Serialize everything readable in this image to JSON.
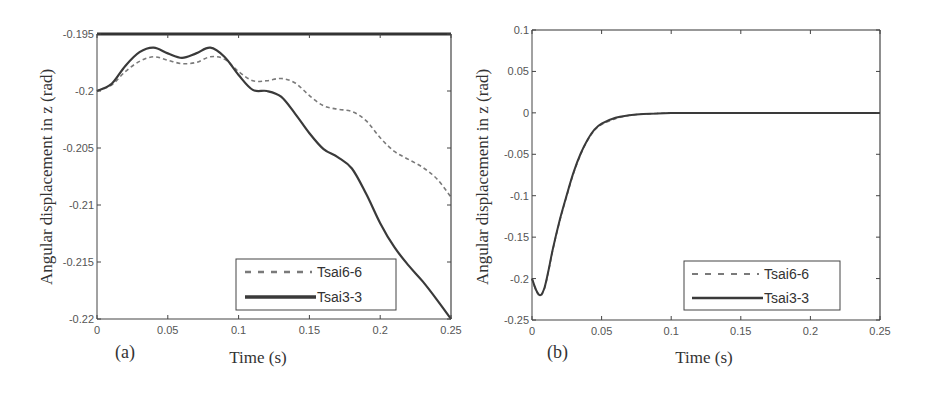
{
  "chart_data": [
    {
      "type": "line",
      "panel_label": "(a)",
      "title": "",
      "xlabel": "Time (s)",
      "ylabel": "Angular displacement in z (rad)",
      "xlim": [
        0,
        0.25
      ],
      "ylim": [
        -0.22,
        -0.195
      ],
      "xticks": [
        0,
        0.05,
        0.1,
        0.15,
        0.2,
        0.25
      ],
      "xtick_labels": [
        "0",
        "0.05",
        "0.1",
        "0.15",
        "0.2",
        "0.25"
      ],
      "yticks": [
        -0.195,
        -0.2,
        -0.205,
        -0.21,
        -0.215,
        -0.22
      ],
      "ytick_labels": [
        "-0.195",
        "-0.2",
        "-0.205",
        "-0.21",
        "-0.215",
        "-0.22"
      ],
      "grid": false,
      "legend_position": "lower right",
      "x": [
        0,
        0.01,
        0.02,
        0.03,
        0.04,
        0.05,
        0.06,
        0.07,
        0.08,
        0.09,
        0.1,
        0.11,
        0.12,
        0.13,
        0.14,
        0.15,
        0.16,
        0.17,
        0.18,
        0.19,
        0.2,
        0.21,
        0.22,
        0.23,
        0.24,
        0.25
      ],
      "series": [
        {
          "name": "Tsai6-6",
          "style": "dashed",
          "values": [
            -0.2,
            -0.1995,
            -0.1983,
            -0.1974,
            -0.197,
            -0.1973,
            -0.1976,
            -0.1975,
            -0.197,
            -0.1972,
            -0.1983,
            -0.1991,
            -0.1991,
            -0.1989,
            -0.1993,
            -0.2004,
            -0.2013,
            -0.2016,
            -0.2018,
            -0.2026,
            -0.2041,
            -0.2053,
            -0.206,
            -0.2067,
            -0.2077,
            -0.2093
          ]
        },
        {
          "name": "Tsai3-3",
          "style": "solid",
          "values": [
            -0.2,
            -0.1994,
            -0.1978,
            -0.1966,
            -0.1962,
            -0.1967,
            -0.1971,
            -0.1967,
            -0.1962,
            -0.197,
            -0.1986,
            -0.1999,
            -0.2,
            -0.2005,
            -0.202,
            -0.2037,
            -0.2051,
            -0.2058,
            -0.2068,
            -0.209,
            -0.2116,
            -0.2137,
            -0.2153,
            -0.2167,
            -0.2183,
            -0.22
          ]
        }
      ]
    },
    {
      "type": "line",
      "panel_label": "(b)",
      "title": "",
      "xlabel": "Time (s)",
      "ylabel": "Angular displacement in z (rad)",
      "xlim": [
        0,
        0.25
      ],
      "ylim": [
        -0.25,
        0.1
      ],
      "xticks": [
        0,
        0.05,
        0.1,
        0.15,
        0.2,
        0.25
      ],
      "xtick_labels": [
        "0",
        "0.05",
        "0.1",
        "0.15",
        "0.2",
        "0.25"
      ],
      "yticks": [
        0.1,
        0.05,
        0,
        -0.05,
        -0.1,
        -0.15,
        -0.2,
        -0.25
      ],
      "ytick_labels": [
        "0.1",
        "0.05",
        "0",
        "-0.05",
        "-0.1",
        "-0.15",
        "-0.2",
        "-0.25"
      ],
      "grid": false,
      "legend_position": "lower right",
      "x": [
        0,
        0.003,
        0.006,
        0.009,
        0.012,
        0.015,
        0.02,
        0.025,
        0.03,
        0.035,
        0.04,
        0.045,
        0.05,
        0.06,
        0.07,
        0.08,
        0.09,
        0.1,
        0.12,
        0.15,
        0.2,
        0.25
      ],
      "series": [
        {
          "name": "Tsai6-6",
          "style": "dashed",
          "values": [
            -0.2,
            -0.215,
            -0.221,
            -0.212,
            -0.19,
            -0.165,
            -0.13,
            -0.1,
            -0.072,
            -0.05,
            -0.033,
            -0.021,
            -0.014,
            -0.007,
            -0.003,
            -0.0015,
            -0.0007,
            -0.0003,
            0,
            0,
            0,
            0
          ]
        },
        {
          "name": "Tsai3-3",
          "style": "solid",
          "values": [
            -0.2,
            -0.214,
            -0.22,
            -0.211,
            -0.189,
            -0.164,
            -0.129,
            -0.099,
            -0.071,
            -0.049,
            -0.032,
            -0.02,
            -0.013,
            -0.006,
            -0.003,
            -0.0014,
            -0.0006,
            -0.0002,
            0,
            0,
            0,
            0
          ]
        }
      ]
    }
  ],
  "figure": {
    "panels": [
      {
        "label": "(a)",
        "xlabel": "Time (s)",
        "ylabel": "Angular displacement in z (rad)",
        "legend": [
          "Tsai6-6",
          "Tsai3-3"
        ]
      },
      {
        "label": "(b)",
        "xlabel": "Time (s)",
        "ylabel": "Angular displacement in z (rad)",
        "legend": [
          "Tsai6-6",
          "Tsai3-3"
        ]
      }
    ],
    "colors": {
      "axis": "#444444",
      "solid_line": "#3a3a3a",
      "dashed_line": "#7a7a7a"
    }
  }
}
